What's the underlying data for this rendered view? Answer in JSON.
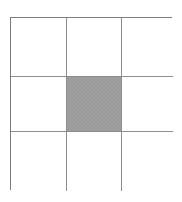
{
  "figure": {
    "type": "grid-diagram",
    "rows": 3,
    "columns": 3,
    "background_color": "#ffffff",
    "line_color": "#8d8d8d",
    "outer_border_color": "#7d7d7d",
    "fill_color": "#9a9a9a"
  },
  "grid": {
    "cells": [
      {
        "row": 1,
        "column": 1,
        "label": "",
        "state": "empty",
        "fill": "#ffffff"
      },
      {
        "row": 1,
        "column": 2,
        "label": "",
        "state": "empty",
        "fill": "#ffffff"
      },
      {
        "row": 1,
        "column": 3,
        "label": "",
        "state": "empty",
        "fill": "#ffffff"
      },
      {
        "row": 2,
        "column": 1,
        "label": "",
        "state": "empty",
        "fill": "#ffffff"
      },
      {
        "row": 2,
        "column": 2,
        "label": "",
        "state": "filled",
        "fill": "#9a9a9a"
      },
      {
        "row": 2,
        "column": 3,
        "label": "",
        "state": "empty",
        "fill": "#ffffff"
      },
      {
        "row": 3,
        "column": 1,
        "label": "",
        "state": "empty",
        "fill": "#ffffff"
      },
      {
        "row": 3,
        "column": 2,
        "label": "",
        "state": "empty",
        "fill": "#ffffff"
      },
      {
        "row": 3,
        "column": 3,
        "label": "",
        "state": "empty",
        "fill": "#ffffff"
      }
    ]
  }
}
